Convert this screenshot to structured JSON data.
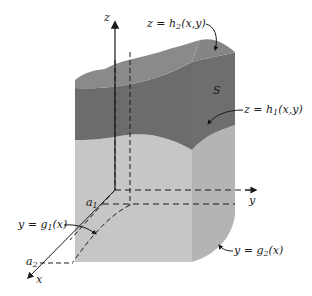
{
  "figure": {
    "type": "3D solid region between two surfaces",
    "colors": {
      "top_surface": "#8a8a8a",
      "upper_band": "#7a7a7a",
      "lower_dark_band": "#6a6a6a",
      "side_light": "#c4c4c4",
      "side_front": "#b2b2b2",
      "axis": "#1a1a1a"
    },
    "axes": {
      "z": "z",
      "y": "y",
      "x": "x"
    },
    "labels": {
      "upper_surface": {
        "lhs": "z = h",
        "sub": "2",
        "rhs": "(x,y)"
      },
      "lower_surface": {
        "lhs": "z = h",
        "sub": "1",
        "rhs": "(x,y)"
      },
      "region": "S",
      "curve_g1": {
        "lhs": "y = g",
        "sub": "1",
        "rhs": "(x)"
      },
      "curve_g2": {
        "lhs": "y = g",
        "sub": "2",
        "rhs": "(x)"
      },
      "a1": {
        "base": "a",
        "sub": "1"
      },
      "a2": {
        "base": "a",
        "sub": "2"
      }
    }
  }
}
